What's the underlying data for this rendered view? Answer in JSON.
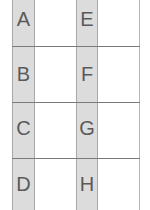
{
  "grid": {
    "rows": 4,
    "columns": 2,
    "column_1": [
      "A",
      "B",
      "C",
      "D"
    ],
    "column_2": [
      "E",
      "F",
      "G",
      "H"
    ],
    "colors": {
      "band_fill": "#dcdcdc",
      "divider": "#7a7a7a",
      "text": "#5a5a5a",
      "background": "#ffffff"
    }
  }
}
